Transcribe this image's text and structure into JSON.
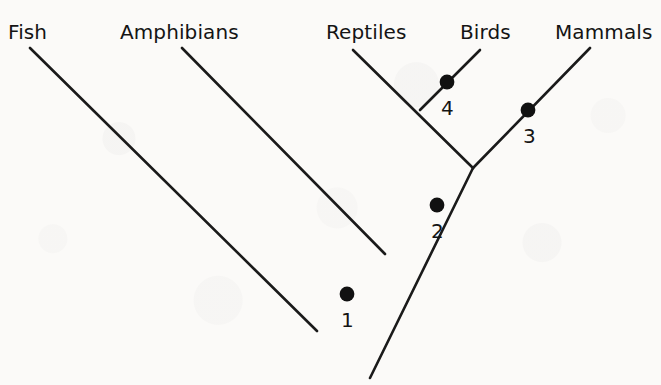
{
  "diagram": {
    "kind": "cladogram",
    "title": "",
    "stroke_color": "#1a1a1a",
    "node_color": "#111111",
    "background_color": "#fbfaf8",
    "taxa": [
      {
        "label": "Fish",
        "label_x": 8,
        "label_y": 20,
        "tip_x": 30,
        "tip_y": 48
      },
      {
        "label": "Amphibians",
        "label_x": 120,
        "label_y": 20,
        "tip_x": 182,
        "tip_y": 48
      },
      {
        "label": "Reptiles",
        "label_x": 326,
        "label_y": 20,
        "tip_x": 353,
        "tip_y": 50
      },
      {
        "label": "Birds",
        "label_x": 460,
        "label_y": 20,
        "tip_x": 480,
        "tip_y": 50
      },
      {
        "label": "Mammals",
        "label_x": 555,
        "label_y": 20,
        "tip_x": 590,
        "tip_y": 48
      }
    ],
    "nodes": [
      {
        "id": "1",
        "cx": 347,
        "cy": 294,
        "label_x": 341,
        "label_y": 308
      },
      {
        "id": "2",
        "cx": 437,
        "cy": 205,
        "label_x": 431,
        "label_y": 219
      },
      {
        "id": "3",
        "cx": 528,
        "cy": 110,
        "label_x": 523,
        "label_y": 124
      },
      {
        "id": "4",
        "cx": 447,
        "cy": 82,
        "label_x": 441,
        "label_y": 96
      }
    ],
    "branches": [
      {
        "name": "trunk-root",
        "x1": 370,
        "y1": 378,
        "x2": 473,
        "y2": 168
      },
      {
        "name": "trunk-to-mammals",
        "x1": 473,
        "y1": 168,
        "x2": 590,
        "y2": 48
      },
      {
        "name": "fish-branch",
        "x1": 30,
        "y1": 48,
        "x2": 317,
        "y2": 331
      },
      {
        "name": "amphibians-branch",
        "x1": 182,
        "y1": 48,
        "x2": 385,
        "y2": 254
      },
      {
        "name": "reptiles-branch",
        "x1": 353,
        "y1": 50,
        "x2": 473,
        "y2": 168
      },
      {
        "name": "birds-branch",
        "x1": 480,
        "y1": 50,
        "x2": 420,
        "y2": 110
      }
    ]
  }
}
